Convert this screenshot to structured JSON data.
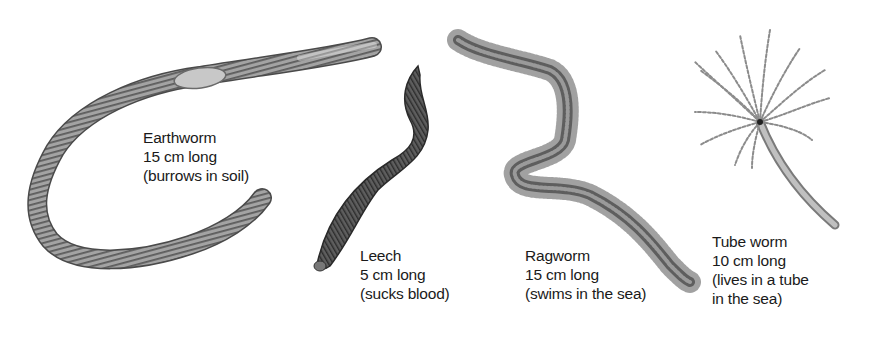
{
  "figure": {
    "colors": {
      "background": "#ffffff",
      "text": "#1a1a1a",
      "earthworm_body": "#9a9a9a",
      "earthworm_rings": "#5a5a5a",
      "earthworm_clitellum": "#c4c4c4",
      "leech_body": "#555555",
      "leech_stripes": "#2e2e2e",
      "ragworm_body": "#6e6e6e",
      "ragworm_bristles": "#7a7a7a",
      "tubeworm_tentacles": "#8c8c8c",
      "tubeworm_tube": "#a8a8a8"
    },
    "specimens": [
      {
        "id": "earthworm",
        "name": "Earthworm",
        "length": "15 cm long",
        "note": "(burrows in soil)"
      },
      {
        "id": "leech",
        "name": "Leech",
        "length": "5 cm long",
        "note": "(sucks blood)"
      },
      {
        "id": "ragworm",
        "name": "Ragworm",
        "length": "15 cm long",
        "note": "(swims in the sea)"
      },
      {
        "id": "tube-worm",
        "name": "Tube worm",
        "length": "10 cm long",
        "note": "(lives in a tube",
        "note_line2": "in the sea)"
      }
    ]
  }
}
